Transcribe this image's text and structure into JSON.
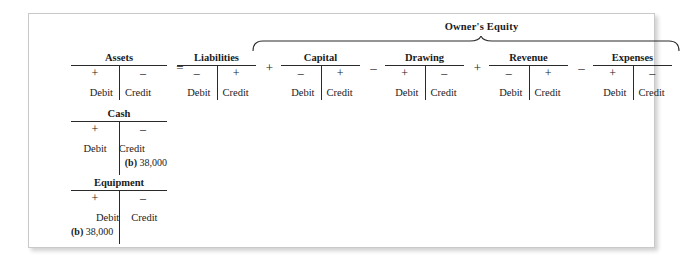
{
  "figure": {
    "group_label": "Owner's Equity",
    "equation_accounts": [
      {
        "name": "Assets",
        "debit_sign": "+",
        "credit_sign": "–",
        "debit_label": "Debit",
        "credit_label": "Credit",
        "operator_after": "=",
        "x": 42,
        "width": 96
      },
      {
        "name": "Liabilities",
        "debit_sign": "–",
        "credit_sign": "+",
        "debit_label": "Debit",
        "credit_label": "Credit",
        "operator_after": "+",
        "x": 148,
        "width": 79
      },
      {
        "name": "Capital",
        "debit_sign": "–",
        "credit_sign": "+",
        "debit_label": "Debit",
        "credit_label": "Credit",
        "operator_after": "–",
        "x": 252,
        "width": 79
      },
      {
        "name": "Drawing",
        "debit_sign": "+",
        "credit_sign": "–",
        "debit_label": "Debit",
        "credit_label": "Credit",
        "operator_after": "+",
        "x": 356,
        "width": 79
      },
      {
        "name": "Revenue",
        "debit_sign": "–",
        "credit_sign": "+",
        "debit_label": "Debit",
        "credit_label": "Credit",
        "operator_after": "–",
        "x": 460,
        "width": 79
      },
      {
        "name": "Expenses",
        "debit_sign": "+",
        "credit_sign": "–",
        "debit_label": "Debit",
        "credit_label": "Credit",
        "operator_after": "",
        "x": 564,
        "width": 79
      }
    ],
    "detail_accounts": [
      {
        "name": "Cash",
        "debit_sign": "+",
        "credit_sign": "–",
        "debit_label": "Debit",
        "credit_label": "Credit",
        "debit_entry_ref": "",
        "debit_entry_amount": "",
        "credit_entry_ref": "(b)",
        "credit_entry_amount": "38,000"
      },
      {
        "name": "Equipment",
        "debit_sign": "+",
        "credit_sign": "–",
        "debit_label": "Debit",
        "credit_label": "Credit",
        "debit_entry_ref": "(b)",
        "debit_entry_amount": "38,000",
        "credit_entry_ref": "",
        "credit_entry_amount": ""
      }
    ]
  },
  "colors": {
    "rule": "#2a2a2a",
    "border": "#c9c9c9",
    "text": "#1a1a1a",
    "background": "#ffffff"
  }
}
